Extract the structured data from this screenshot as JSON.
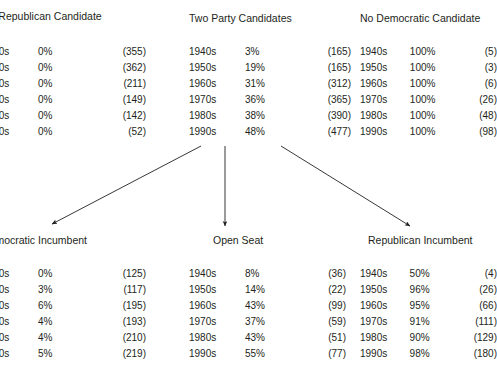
{
  "figure": {
    "background_color": "#ffffff",
    "text_color": "#231f20",
    "arrow_color": "#231f20"
  },
  "panels": {
    "no_republican_candidate": {
      "title": "No Republican Candidate",
      "columns": [
        "decade",
        "percent",
        "count"
      ],
      "rows": [
        {
          "decade": "1940s",
          "percent": "0%",
          "count": "(355)"
        },
        {
          "decade": "1950s",
          "percent": "0%",
          "count": "(362)"
        },
        {
          "decade": "1960s",
          "percent": "0%",
          "count": "(211)"
        },
        {
          "decade": "1970s",
          "percent": "0%",
          "count": "(149)"
        },
        {
          "decade": "1980s",
          "percent": "0%",
          "count": "(142)"
        },
        {
          "decade": "1990s",
          "percent": "0%",
          "count": "(52)"
        }
      ]
    },
    "two_party_candidates": {
      "title": "Two Party Candidates",
      "columns": [
        "decade",
        "percent",
        "count"
      ],
      "rows": [
        {
          "decade": "1940s",
          "percent": "3%",
          "count": "(165)"
        },
        {
          "decade": "1950s",
          "percent": "19%",
          "count": "(165)"
        },
        {
          "decade": "1960s",
          "percent": "31%",
          "count": "(312)"
        },
        {
          "decade": "1970s",
          "percent": "36%",
          "count": "(365)"
        },
        {
          "decade": "1980s",
          "percent": "38%",
          "count": "(390)"
        },
        {
          "decade": "1990s",
          "percent": "48%",
          "count": "(477)"
        }
      ]
    },
    "no_democratic_candidate": {
      "title": "No Democratic Candidate",
      "columns": [
        "decade",
        "percent",
        "count"
      ],
      "rows": [
        {
          "decade": "1940s",
          "percent": "100%",
          "count": "(5)"
        },
        {
          "decade": "1950s",
          "percent": "100%",
          "count": "(3)"
        },
        {
          "decade": "1960s",
          "percent": "100%",
          "count": "(6)"
        },
        {
          "decade": "1970s",
          "percent": "100%",
          "count": "(26)"
        },
        {
          "decade": "1980s",
          "percent": "100%",
          "count": "(48)"
        },
        {
          "decade": "1990s",
          "percent": "100%",
          "count": "(98)"
        }
      ]
    },
    "democratic_incumbent": {
      "title": "Democratic Incumbent",
      "columns": [
        "decade",
        "percent",
        "count"
      ],
      "rows": [
        {
          "decade": "1940s",
          "percent": "0%",
          "count": "(125)"
        },
        {
          "decade": "1950s",
          "percent": "3%",
          "count": "(117)"
        },
        {
          "decade": "1960s",
          "percent": "6%",
          "count": "(195)"
        },
        {
          "decade": "1970s",
          "percent": "4%",
          "count": "(193)"
        },
        {
          "decade": "1980s",
          "percent": "4%",
          "count": "(210)"
        },
        {
          "decade": "1990s",
          "percent": "5%",
          "count": "(219)"
        }
      ]
    },
    "open_seat": {
      "title": "Open Seat",
      "columns": [
        "decade",
        "percent",
        "count"
      ],
      "rows": [
        {
          "decade": "1940s",
          "percent": "8%",
          "count": "(36)"
        },
        {
          "decade": "1950s",
          "percent": "14%",
          "count": "(22)"
        },
        {
          "decade": "1960s",
          "percent": "43%",
          "count": "(99)"
        },
        {
          "decade": "1970s",
          "percent": "37%",
          "count": "(59)"
        },
        {
          "decade": "1980s",
          "percent": "43%",
          "count": "(51)"
        },
        {
          "decade": "1990s",
          "percent": "55%",
          "count": "(77)"
        }
      ]
    },
    "republican_incumbent": {
      "title": "Republican Incumbent",
      "columns": [
        "decade",
        "percent",
        "count"
      ],
      "rows": [
        {
          "decade": "1940s",
          "percent": "50%",
          "count": "(4)"
        },
        {
          "decade": "1950s",
          "percent": "96%",
          "count": "(26)"
        },
        {
          "decade": "1960s",
          "percent": "95%",
          "count": "(66)"
        },
        {
          "decade": "1970s",
          "percent": "91%",
          "count": "(111)"
        },
        {
          "decade": "1980s",
          "percent": "90%",
          "count": "(129)"
        },
        {
          "decade": "1990s",
          "percent": "98%",
          "count": "(180)"
        }
      ]
    }
  },
  "arrows": [
    {
      "name": "arrow-two-party-to-democratic-incumbent",
      "x1": 201,
      "y1": 146,
      "x2": 50,
      "y2": 225
    },
    {
      "name": "arrow-two-party-to-open-seat",
      "x1": 225,
      "y1": 146,
      "x2": 225,
      "y2": 228
    },
    {
      "name": "arrow-two-party-to-republican-incumbent",
      "x1": 281,
      "y1": 146,
      "x2": 412,
      "y2": 228
    }
  ]
}
